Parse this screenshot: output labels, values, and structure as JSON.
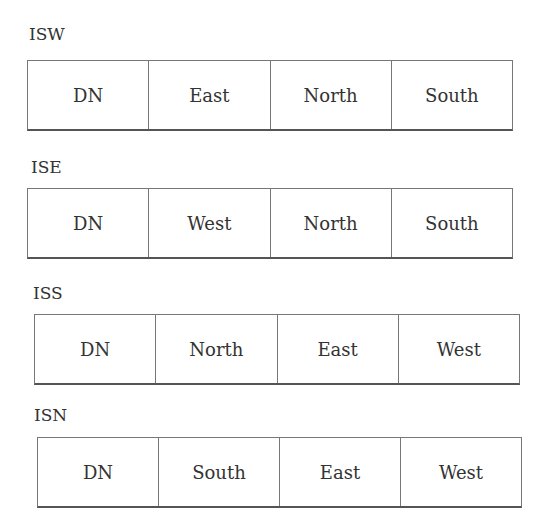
{
  "groups": [
    {
      "label": "ISW",
      "cells": [
        "DN",
        "East",
        "North",
        "South"
      ]
    },
    {
      "label": "ISE",
      "cells": [
        "DN",
        "West",
        "North",
        "South"
      ]
    },
    {
      "label": "ISS",
      "cells": [
        "DN",
        "North",
        "East",
        "West"
      ]
    },
    {
      "label": "ISN",
      "cells": [
        "DN",
        "South",
        "East",
        "West"
      ]
    }
  ]
}
